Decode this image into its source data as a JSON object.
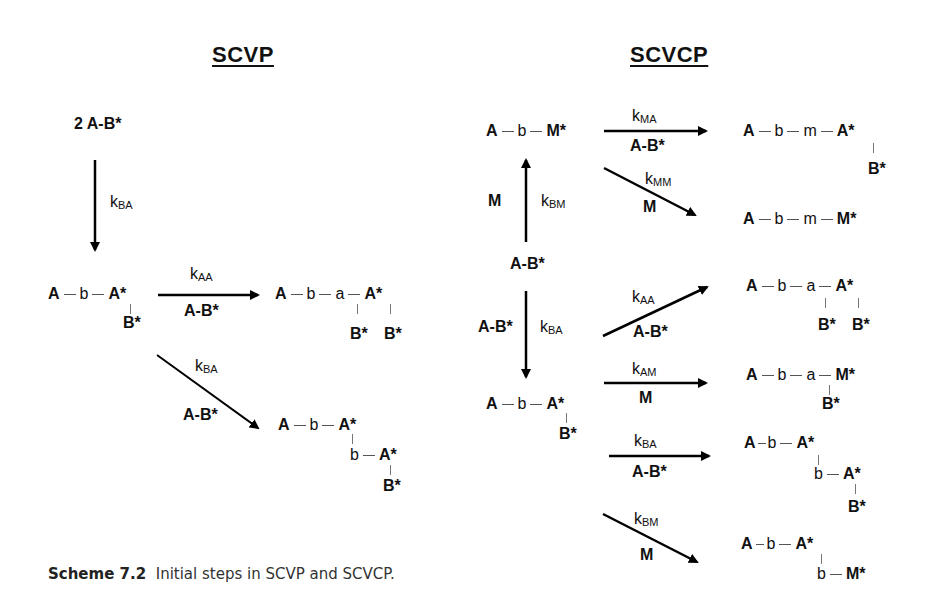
{
  "titles": {
    "left": "SCVP",
    "right": "SCVCP"
  },
  "scvp": {
    "start": "2 A-B*",
    "step1": {
      "k_main": "k",
      "k_sub": "BA"
    },
    "intermediate": {
      "chain": [
        "A",
        "b",
        "A*"
      ],
      "branch": "B*"
    },
    "path_aa": {
      "k_main": "k",
      "k_sub": "AA",
      "reagent": "A-B*",
      "product": {
        "chain": [
          "A",
          "b",
          "a",
          "A*"
        ],
        "branch_a": "B*",
        "branch_A": "B*"
      }
    },
    "path_ba": {
      "k_main": "k",
      "k_sub": "BA",
      "reagent": "A-B*",
      "product": {
        "chain": [
          "A",
          "b",
          "A*"
        ],
        "chain2": [
          "b",
          "A*"
        ],
        "branch": "B*"
      }
    }
  },
  "scvcp": {
    "center": "A-B*",
    "up": {
      "reagent": "M",
      "k_main": "k",
      "k_sub": "BM",
      "product": {
        "chain": [
          "A",
          "b",
          "M*"
        ]
      }
    },
    "down": {
      "reagent": "A-B*",
      "k_main": "k",
      "k_sub": "BA",
      "product": {
        "chain": [
          "A",
          "b",
          "A*"
        ],
        "branch": "B*"
      }
    },
    "from_up": [
      {
        "k_main": "k",
        "k_sub": "MA",
        "reagent": "A-B*",
        "product": {
          "chain": [
            "A",
            "b",
            "m",
            "A*"
          ],
          "branch": "B*"
        }
      },
      {
        "k_main": "k",
        "k_sub": "MM",
        "reagent": "M",
        "product": {
          "chain": [
            "A",
            "b",
            "m",
            "M*"
          ]
        }
      }
    ],
    "from_down": [
      {
        "k_main": "k",
        "k_sub": "AA",
        "reagent": "A-B*",
        "product": {
          "chain": [
            "A",
            "b",
            "a",
            "A*"
          ],
          "branch_a": "B*",
          "branch_A": "B*"
        }
      },
      {
        "k_main": "k",
        "k_sub": "AM",
        "reagent": "M",
        "product": {
          "chain": [
            "A",
            "b",
            "a",
            "M*"
          ],
          "branch": "B*"
        }
      },
      {
        "k_main": "k",
        "k_sub": "BA",
        "reagent": "A-B*",
        "product": {
          "chain": [
            "A",
            "b",
            "A*"
          ],
          "chain2": [
            "b",
            "A*"
          ],
          "branch": "B*"
        }
      },
      {
        "k_main": "k",
        "k_sub": "BM",
        "reagent": "M",
        "product": {
          "chain": [
            "A",
            "b",
            "A*"
          ],
          "chain2": [
            "b",
            "M*"
          ]
        }
      }
    ]
  },
  "caption": {
    "label": "Scheme 7.2",
    "text": "Initial steps in SCVP and SCVCP."
  }
}
